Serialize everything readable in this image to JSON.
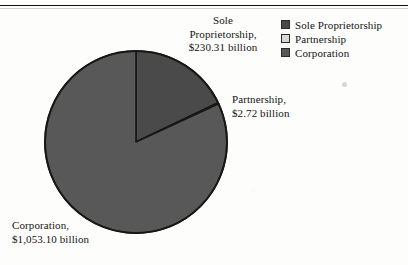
{
  "chart_data": {
    "type": "pie",
    "title": "",
    "units": "billion dollars",
    "categories": [
      "Sole Proprietorship",
      "Partnership",
      "Corporation"
    ],
    "values": [
      230.31,
      2.72,
      1053.1
    ],
    "value_labels": [
      "$230.31 billion",
      "$2.72 billion",
      "$1,053.10 billion"
    ],
    "percentages": [
      17.91,
      0.21,
      81.88
    ],
    "total": 1286.13,
    "start_angle_deg": 0,
    "direction": "clockwise",
    "legend_position": "top-right",
    "grid": false,
    "colors": [
      "#4a4a4a",
      "#d8d8d8",
      "#585858"
    ],
    "slices": [
      {
        "name": "Sole Proprietorship",
        "value": 230.31,
        "label": "$230.31 billion",
        "percent": 17.91,
        "color": "#4a4a4a"
      },
      {
        "name": "Partnership",
        "value": 2.72,
        "label": "$2.72 billion",
        "percent": 0.21,
        "color": "#d8d8d8"
      },
      {
        "name": "Corporation",
        "value": 1053.1,
        "label": "$1,053.10 billion",
        "percent": 81.88,
        "color": "#585858"
      }
    ]
  },
  "title_remnant": "",
  "callouts": {
    "sole": "Sole\nProprietorship,\n$230.31 billion",
    "partnership": "Partnership,\n$2.72 billion",
    "corporation": "Corporation,\n$1,053.10 billion"
  },
  "legend": {
    "items": [
      {
        "label": "Sole Proprietorship",
        "color": "#4a4a4a"
      },
      {
        "label": "Partnership",
        "color": "#d8d8d8"
      },
      {
        "label": "Corporation",
        "color": "#585858"
      }
    ]
  }
}
